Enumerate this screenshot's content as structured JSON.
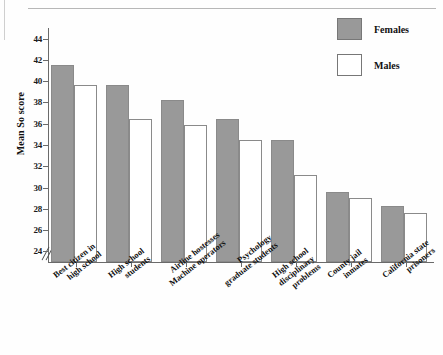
{
  "chart_data": {
    "type": "bar",
    "title": "",
    "xlabel": "",
    "ylabel": "Mean So score",
    "ylim": [
      23,
      45
    ],
    "yticks": [
      24,
      26,
      28,
      30,
      32,
      34,
      36,
      38,
      40,
      42,
      44
    ],
    "axis_break": true,
    "grid": false,
    "legend_position": "top-right",
    "categories": [
      "Best citizen in high school",
      "High school students",
      "Airline hostesses Machine operators",
      "Psychology graduate students",
      "High school disciplinary problems",
      "County jail inmates",
      "California state prisoners"
    ],
    "category_lines": [
      [
        "Best citizen in",
        "high school"
      ],
      [
        "High school",
        "students"
      ],
      [
        "Airline hostesses",
        "Machine operators"
      ],
      [
        "Psychology",
        "graduate students"
      ],
      [
        "High school",
        "disciplinary",
        "problems"
      ],
      [
        "County jail",
        "inmates"
      ],
      [
        "California state",
        "prisoners"
      ]
    ],
    "series": [
      {
        "name": "Females",
        "color": "#999999",
        "values": [
          41.5,
          39.6,
          38.25,
          36.4,
          34.5,
          29.55,
          28.3
        ]
      },
      {
        "name": "Males",
        "color": "#ffffff",
        "values": [
          39.6,
          36.45,
          35.85,
          34.5,
          31.2,
          29.0,
          27.6
        ]
      }
    ]
  },
  "legend": {
    "items": [
      {
        "label": "Females",
        "swatch": "filled-gray"
      },
      {
        "label": "Males",
        "swatch": "outline-white"
      }
    ]
  },
  "axes": {
    "y_title": "Mean So score",
    "y_tick_labels": [
      "44",
      "42",
      "40",
      "38",
      "36",
      "34",
      "32",
      "30",
      "28",
      "26",
      "24"
    ]
  },
  "colors": {
    "female_fill": "#999999",
    "male_fill": "#ffffff",
    "bar_stroke": "#8a8a8a",
    "axis": "#6a6a6a",
    "text": "#111111",
    "page_rule": "#b7b7b7"
  }
}
